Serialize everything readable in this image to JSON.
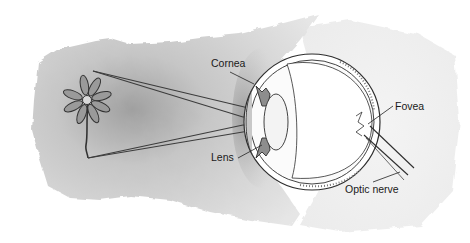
{
  "diagram": {
    "object": "flower",
    "labels": {
      "cornea": "Cornea",
      "lens": "Lens",
      "fovea": "Fovea",
      "optic_nerve": "Optic nerve"
    },
    "colors": {
      "background": "#ffffff",
      "wash_light": "#e4e4e4",
      "wash_dark": "#a9a9a9",
      "line": "#3a3a3a",
      "text": "#1a1a1a"
    }
  }
}
